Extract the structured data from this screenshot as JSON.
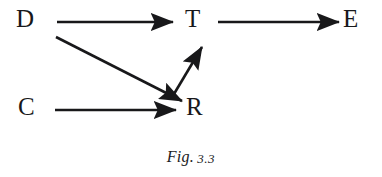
{
  "figure": {
    "caption_word": "Fig.",
    "caption_number": "3.3",
    "caption_full": "Fig. 3.3",
    "background_color": "#ffffff",
    "ink_color": "#18181a"
  },
  "graph": {
    "type": "directed-graph",
    "nodes": [
      {
        "id": "D",
        "label": "D",
        "x": 24,
        "y": 21
      },
      {
        "id": "T",
        "label": "T",
        "x": 195,
        "y": 21
      },
      {
        "id": "E",
        "label": "E",
        "x": 352,
        "y": 21
      },
      {
        "id": "C",
        "label": "C",
        "x": 27,
        "y": 109
      },
      {
        "id": "R",
        "label": "R",
        "x": 196,
        "y": 109
      }
    ],
    "edges": [
      {
        "id": "D-T",
        "from": "D",
        "to": "T",
        "x1": 57,
        "y1": 22,
        "x2": 173,
        "y2": 22
      },
      {
        "id": "T-E",
        "from": "T",
        "to": "E",
        "x1": 218,
        "y1": 22,
        "x2": 339,
        "y2": 22
      },
      {
        "id": "C-R",
        "from": "C",
        "to": "R",
        "x1": 55,
        "y1": 110,
        "x2": 176,
        "y2": 110
      },
      {
        "id": "D-R",
        "from": "D",
        "to": "R",
        "x1": 56,
        "y1": 37,
        "x2": 182,
        "y2": 101
      },
      {
        "id": "R-T",
        "from": "R",
        "to": "T",
        "x1": 171,
        "y1": 99,
        "x2": 202,
        "y2": 46
      }
    ],
    "edge_stroke_width": 2.6,
    "arrowhead_length": 15,
    "arrowhead_width": 11
  }
}
